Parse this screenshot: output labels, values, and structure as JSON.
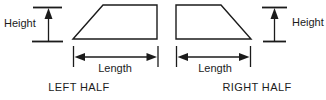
{
  "diagram": {
    "left_figure": {
      "caption": "LEFT HALF",
      "height_label": "Height",
      "length_label": "Length"
    },
    "right_figure": {
      "caption": "RIGHT HALF",
      "height_label": "Height",
      "length_label": "Length"
    },
    "colors": {
      "line": "#1b1b1b",
      "background": "#ffffff"
    }
  }
}
